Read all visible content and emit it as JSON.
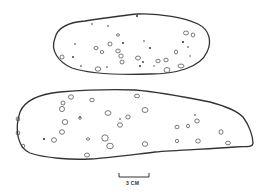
{
  "figure": {
    "objects": [
      {
        "name": "upper-stone",
        "shape": "oval"
      },
      {
        "name": "lower-stone",
        "shape": "elongated tapering"
      }
    ],
    "scale_bar": {
      "label": "3 CM",
      "length_units": 3,
      "unit": "cm"
    }
  }
}
